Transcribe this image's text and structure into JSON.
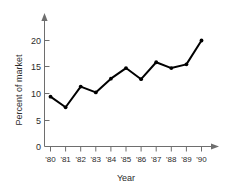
{
  "chart_data": {
    "type": "line",
    "title": "",
    "xlabel": "Year",
    "ylabel": "Percent of market",
    "categories": [
      "'80",
      "'81",
      "'82",
      "'83",
      "'84",
      "'85",
      "'86",
      "'87",
      "'88",
      "'89",
      "'90"
    ],
    "values": [
      9.4,
      7.4,
      11.3,
      10.2,
      12.8,
      14.8,
      12.7,
      15.9,
      14.8,
      15.5,
      20.0
    ],
    "series": [
      {
        "name": "Percent of market",
        "values": [
          9.4,
          7.4,
          11.3,
          10.2,
          12.8,
          14.8,
          12.7,
          15.9,
          14.8,
          15.5,
          20.0
        ]
      }
    ],
    "ylim": [
      0,
      21.5
    ],
    "yticks": [
      0,
      5,
      10,
      15,
      20
    ],
    "ytick_labels": [
      "0",
      "5",
      "10",
      "15",
      "20"
    ],
    "xtick_labels": [
      "'80",
      "'81",
      "'82",
      "'83",
      "'84",
      "'85",
      "'86",
      "'87",
      "'88",
      "'89",
      "'90"
    ],
    "grid": false,
    "legend": false,
    "legend_position": "none",
    "markers": "filled-circle",
    "line_color": "#000000",
    "axis_color": "#6e6e6e",
    "axis_arrows": true,
    "background": "#ffffff"
  }
}
